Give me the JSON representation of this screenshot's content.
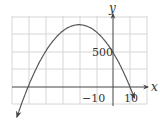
{
  "chart_data": {
    "type": "line",
    "title": "",
    "xlabel": "x",
    "ylabel": "y",
    "function": "y = -x^2 - 40x + 500",
    "tick_labels": {
      "x": [
        "-10",
        "10"
      ],
      "y": [
        "500"
      ]
    },
    "xlim": [
      -60,
      20
    ],
    "ylim": [
      -250,
      1000
    ],
    "grid": true,
    "grid_step": {
      "x": 10,
      "y": 250
    },
    "x_intercepts": [
      -50,
      10
    ],
    "y_intercept": 500,
    "vertex": [
      -20,
      900
    ],
    "x": [
      -53,
      -50,
      -40,
      -30,
      -20,
      -10,
      0,
      10,
      13
    ],
    "values": [
      -159,
      0,
      400,
      800,
      900,
      800,
      500,
      0,
      -189
    ],
    "ends_with_arrows": true
  },
  "labels": {
    "x_axis": "x",
    "y_axis": "y",
    "y_tick_500": "500",
    "x_tick_neg10": "−10",
    "x_tick_10": "10"
  },
  "colors": {
    "grid": "#d6d6d6",
    "axis": "#444444",
    "curve": "#555555",
    "text": "#333333"
  }
}
